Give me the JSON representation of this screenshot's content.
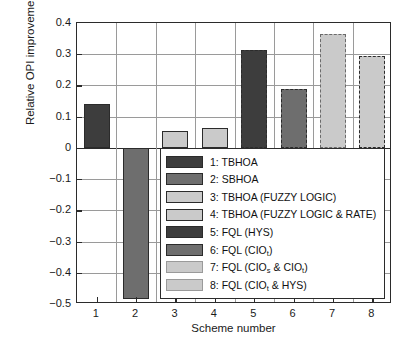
{
  "chart_data": {
    "type": "bar",
    "title": "",
    "xlabel": "Scheme number",
    "ylabel": "Relative OPI improvement",
    "categories": [
      "1",
      "2",
      "3",
      "4",
      "5",
      "6",
      "7",
      "8"
    ],
    "values": [
      0.141,
      -0.484,
      0.055,
      0.064,
      0.314,
      0.188,
      0.365,
      0.295
    ],
    "ylim": [
      -0.5,
      0.4
    ],
    "yticks": [
      "0.4",
      "0.3",
      "0.2",
      "0.1",
      "0",
      "−0.1",
      "−0.2",
      "−0.3",
      "−0.4",
      "−0.5"
    ],
    "ytick_values": [
      0.4,
      0.3,
      0.2,
      0.1,
      0,
      -0.1,
      -0.2,
      -0.3,
      -0.4,
      -0.5
    ],
    "xticks": [
      "1",
      "2",
      "3",
      "4",
      "5",
      "6",
      "7",
      "8"
    ],
    "grid": true,
    "legend_position": "inside-lower-right",
    "bars": [
      {
        "scheme": "1",
        "value": 0.141,
        "fill": "#3d3d3d",
        "edge": "#2b2b2b",
        "edge_style": "solid"
      },
      {
        "scheme": "2",
        "value": -0.484,
        "fill": "#6e6e6e",
        "edge": "#2b2b2b",
        "edge_style": "solid"
      },
      {
        "scheme": "3",
        "value": 0.055,
        "fill": "#cacaca",
        "edge": "#2b2b2b",
        "edge_style": "solid"
      },
      {
        "scheme": "4",
        "value": 0.064,
        "fill": "#cacaca",
        "edge": "#2b2b2b",
        "edge_style": "solid"
      },
      {
        "scheme": "5",
        "value": 0.314,
        "fill": "#3d3d3d",
        "edge": "#2b2b2b",
        "edge_style": "dashed"
      },
      {
        "scheme": "6",
        "value": 0.188,
        "fill": "#6e6e6e",
        "edge": "#2b2b2b",
        "edge_style": "dashed"
      },
      {
        "scheme": "7",
        "value": 0.365,
        "fill": "#cacaca",
        "edge": "#6a6a6a",
        "edge_style": "dashed"
      },
      {
        "scheme": "8",
        "value": 0.295,
        "fill": "#cacaca",
        "edge": "#2b2b2b",
        "edge_style": "dashed"
      }
    ],
    "legend": [
      {
        "label": "1: TBHOA",
        "html": "1: TBHOA",
        "fill": "#3d3d3d",
        "edge": "#2b2b2b",
        "edge_style": "solid"
      },
      {
        "label": "2: SBHOA",
        "html": "2: SBHOA",
        "fill": "#6e6e6e",
        "edge": "#2b2b2b",
        "edge_style": "solid"
      },
      {
        "label": "3: TBHOA (FUZZY LOGIC)",
        "html": "3: TBHOA (FUZZY LOGIC)",
        "fill": "#cacaca",
        "edge": "#2b2b2b",
        "edge_style": "solid"
      },
      {
        "label": "4: TBHOA (FUZZY LOGIC & RATE)",
        "html": "4: TBHOA (FUZZY LOGIC &amp; RATE)",
        "fill": "#cacaca",
        "edge": "#2b2b2b",
        "edge_style": "solid"
      },
      {
        "label": "5: FQL (HYS)",
        "html": "5: FQL (HYS)",
        "fill": "#3d3d3d",
        "edge": "#2b2b2b",
        "edge_style": "solid"
      },
      {
        "label": "6: FQL (CIOt)",
        "html": "6: FQL (CIO<sub>t</sub>)",
        "fill": "#6e6e6e",
        "edge": "#2b2b2b",
        "edge_style": "solid"
      },
      {
        "label": "7: FQL (CIOs & CIOt)",
        "html": "7: FQL (CIO<sub>s</sub> &amp; CIO<sub>t</sub>)",
        "fill": "#cacaca",
        "edge": "#9a9a9a",
        "edge_style": "solid"
      },
      {
        "label": "8: FQL (CIOt & HYS)",
        "html": "8: FQL (CIO<sub>t</sub> &amp; HYS)",
        "fill": "#cacaca",
        "edge": "#9a9a9a",
        "edge_style": "solid"
      }
    ]
  },
  "colors": {
    "dark_gray": "#3d3d3d",
    "medium_gray": "#6e6e6e",
    "light_gray": "#cacaca",
    "axis": "#2b2b2b",
    "grid": "#9a9a9a",
    "background": "#ffffff"
  }
}
